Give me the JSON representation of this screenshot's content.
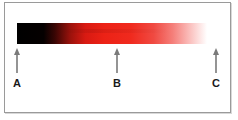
{
  "diagram": {
    "type": "gradient-bar-with-markers",
    "gradient": {
      "start_color": "#000000",
      "middle_color": "#ec2216",
      "end_color": "#ffffff",
      "description": "black to red to white"
    },
    "markers": [
      {
        "label": "A",
        "position": "start"
      },
      {
        "label": "B",
        "position": "middle"
      },
      {
        "label": "C",
        "position": "end"
      }
    ],
    "colors": {
      "frame_border": "#9a9a9a",
      "arrow": "#7a7a7a",
      "label": "#1a1a1a"
    }
  }
}
